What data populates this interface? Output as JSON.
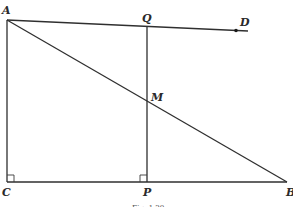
{
  "diagram": {
    "points": {
      "A": {
        "label": "A",
        "x": 7,
        "y": 20
      },
      "Q": {
        "label": "Q",
        "x": 147,
        "y": 28
      },
      "D": {
        "label": "D",
        "x": 236,
        "y": 31
      },
      "M": {
        "label": "M",
        "x": 147,
        "y": 100
      },
      "C": {
        "label": "C",
        "x": 7,
        "y": 182
      },
      "P": {
        "label": "P",
        "x": 147,
        "y": 182
      },
      "B": {
        "label": "B",
        "x": 287,
        "y": 182
      }
    },
    "segments": [
      "AC",
      "CB",
      "AB",
      "QP",
      "AD"
    ],
    "right_angles": [
      "C",
      "P"
    ],
    "caption": "Fig. 1.30"
  }
}
